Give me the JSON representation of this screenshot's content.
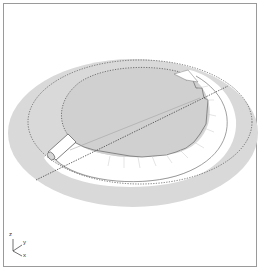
{
  "diagram": {
    "type": "3d-isometric-technical-illustration",
    "axes": {
      "z_label": "z",
      "y_label": "y",
      "x_label": "x"
    },
    "colors": {
      "frame_border": "#9a9a9a",
      "outer_disc": "#d6d6d6",
      "inner_disc": "#cfcfcf",
      "ring_band": "#ffffff",
      "line": "#555555"
    }
  }
}
